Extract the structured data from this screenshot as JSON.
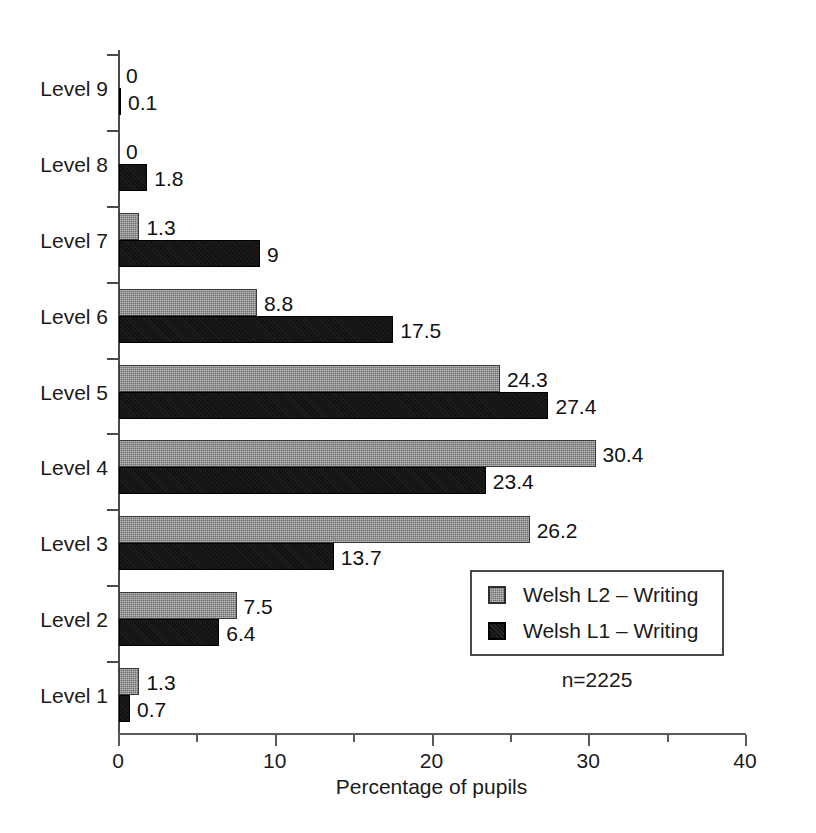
{
  "chart_data": {
    "type": "bar",
    "orientation": "horizontal",
    "title": "",
    "xlabel": "Percentage of pupils",
    "ylabel": "",
    "xlim": [
      0,
      40
    ],
    "xticks": [
      0,
      10,
      20,
      30,
      40
    ],
    "xtick_labels": [
      "0",
      "10",
      "20",
      "30",
      "40"
    ],
    "xminor_ticks": [
      5,
      15,
      25,
      35
    ],
    "grid": false,
    "legend_position": "inside-lower-right",
    "categories": [
      "Level 9",
      "Level 8",
      "Level 7",
      "Level 6",
      "Level 5",
      "Level 4",
      "Level 3",
      "Level 2",
      "Level 1"
    ],
    "series": [
      {
        "name": "Welsh L2 – Writing",
        "color": "#6f6f6f",
        "values": [
          0,
          0,
          1.3,
          8.8,
          24.3,
          30.4,
          26.2,
          7.5,
          1.3
        ],
        "value_labels": [
          "0",
          "0",
          "1.3",
          "8.8",
          "24.3",
          "30.4",
          "26.2",
          "7.5",
          "1.3"
        ]
      },
      {
        "name": "Welsh L1 – Writing",
        "color": "#121212",
        "values": [
          0.1,
          1.8,
          9,
          17.5,
          27.4,
          23.4,
          13.7,
          6.4,
          0.7
        ],
        "value_labels": [
          "0.1",
          "1.8",
          "9",
          "17.5",
          "27.4",
          "23.4",
          "13.7",
          "6.4",
          "0.7"
        ]
      }
    ],
    "annotations": [
      {
        "name": "sample-size",
        "text": "n=2225"
      }
    ]
  },
  "legend": {
    "entries": [
      {
        "label": "Welsh L2 – Writing",
        "swatch": "grey-square-icon"
      },
      {
        "label": "Welsh L1 – Writing",
        "swatch": "black-square-icon"
      }
    ]
  },
  "axis": {
    "x_title": "Percentage of pupils"
  },
  "sample_size": "n=2225"
}
